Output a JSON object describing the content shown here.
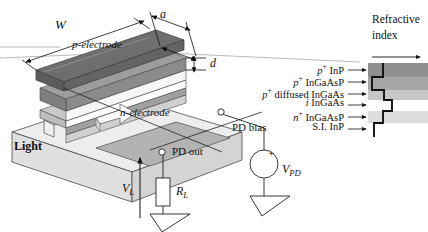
{
  "figure": {
    "type": "waveguide-photodiode-schematic",
    "title_panel": {
      "line1": "Refractive",
      "line2": "index"
    }
  },
  "dimensions": [
    {
      "id": "W",
      "label": "W",
      "desc": "mesa stripe length"
    },
    {
      "id": "a",
      "label": "a",
      "desc": "mesa width"
    },
    {
      "id": "d",
      "label": "d",
      "desc": "absorption layer thickness"
    }
  ],
  "structure_labels": [
    {
      "id": "p-electrode",
      "label": "p-electrode"
    },
    {
      "id": "n-electrode",
      "label": "n-electrode"
    },
    {
      "id": "light",
      "label": "Light"
    }
  ],
  "epitaxial_layers": [
    {
      "id": "p-inp",
      "prefix": "p",
      "sup": "+",
      "name": "InP",
      "shade": "#8f8f8f",
      "index_level": 0.33
    },
    {
      "id": "p-ingaasp",
      "prefix": "p",
      "sup": "+",
      "name": "InGaAsP",
      "shade": "#9e9e9e",
      "index_level": 0.52
    },
    {
      "id": "p-diff-ingaas",
      "prefix": "p",
      "sup": "+",
      "name": "diffused InGaAs",
      "shade": "#b6b6b6",
      "index_level": 0.52
    },
    {
      "id": "i-ingaas",
      "prefix": "i",
      "sup": "",
      "name": "InGaAs",
      "shade": "#ffffff",
      "index_level": 0.7
    },
    {
      "id": "n-ingaasp",
      "prefix": "n",
      "sup": "+",
      "name": "InGaAsP",
      "shade": "#d8d8d8",
      "index_level": 0.52
    },
    {
      "id": "si-inp",
      "prefix": "",
      "sup": "",
      "name": "S.I. InP",
      "shade": "#ffffff",
      "index_level": 0.33
    }
  ],
  "circuit": {
    "nodes": [
      {
        "id": "pd-bias",
        "label": "PD bias"
      },
      {
        "id": "pd-out",
        "label": "PD out"
      }
    ],
    "source": {
      "label": "V",
      "sub": "PD",
      "polarity": "+"
    },
    "resistor": {
      "label": "R",
      "sub": "L"
    },
    "output": {
      "label": "V",
      "sub": "L"
    }
  },
  "colors": {
    "ink": "#111111",
    "hairline": "#9a9a9a",
    "band_dark": "#8f8f8f",
    "band_mid": "#a6a6a6",
    "band_light": "#d8d8d8",
    "band_white": "#ffffff",
    "mesa_top": "#6d6d6d",
    "substrate": "#e6e6e6"
  }
}
